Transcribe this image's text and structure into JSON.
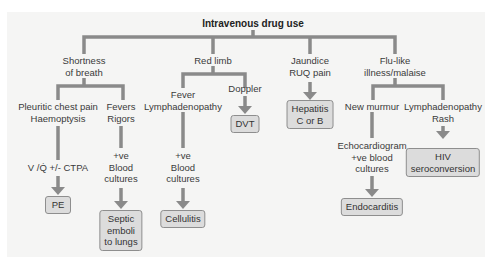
{
  "title": "Intravenous drug use",
  "colors": {
    "connector": "#8a8a8a",
    "box_fill": "#dcdcdc",
    "box_border": "#8e8e8e",
    "panel": "#f5f5f4"
  },
  "branches": {
    "sob": {
      "label_1": "Shortness",
      "label_2": "of breath",
      "pleuritic": {
        "l1": "Pleuritic chest pain",
        "l2": "Haemoptysis",
        "test": "V /Q̇ +/- CTPA",
        "result": "PE"
      },
      "fevers": {
        "l1": "Fevers",
        "l2": "Rigors",
        "t1": "+ve",
        "t2": "Blood",
        "t3": "cultures",
        "r1": "Septic",
        "r2": "emboli",
        "r3": "to lungs"
      }
    },
    "red_limb": {
      "label": "Red limb",
      "fever": {
        "l1": "Fever",
        "l2": "Lymphadenopathy",
        "t1": "+ve",
        "t2": "Blood",
        "t3": "cultures",
        "result": "Cellulitis"
      },
      "doppler": {
        "label": "Doppler",
        "result": "DVT"
      }
    },
    "jaundice": {
      "l1": "Jaundice",
      "l2": "RUQ pain",
      "r1": "Hepatitis",
      "r2": "C or B"
    },
    "flu": {
      "l1": "Flu-like",
      "l2": "illness/malaise",
      "murmur": {
        "label": "New murmur",
        "t1": "Echocardiogram",
        "t2": "+ve blood",
        "t3": "cultures",
        "result": "Endocarditis"
      },
      "lymph": {
        "l1": "Lymphadenopathy",
        "l2": "Rash",
        "r1": "HIV",
        "r2": "seroconversion"
      }
    }
  }
}
